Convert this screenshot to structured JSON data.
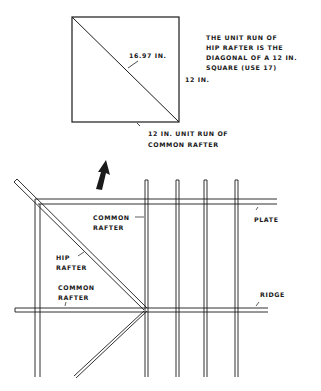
{
  "square_diagram": {
    "diagonal_label": "16.97 IN.",
    "side_label": "12 IN.",
    "bottom_label_line1": "12 IN. UNIT RUN OF",
    "bottom_label_line2": "COMMON RAFTER",
    "note_line1": "THE UNIT RUN OF",
    "note_line2": "HIP RAFTER IS THE",
    "note_line3": "DIAGONAL OF A 12 IN.",
    "note_line4": "SQUARE (USE 17)"
  },
  "framing_plan": {
    "common_rafter_top_line1": "COMMON",
    "common_rafter_top_line2": "RAFTER",
    "plate_label": "PLATE",
    "hip_rafter_line1": "HIP",
    "hip_rafter_line2": "RAFTER",
    "common_rafter_left_line1": "COMMON",
    "common_rafter_left_line2": "RAFTER",
    "ridge_label": "RIDGE"
  },
  "colors": {
    "line": "#1a1a1a",
    "background": "#ffffff"
  }
}
